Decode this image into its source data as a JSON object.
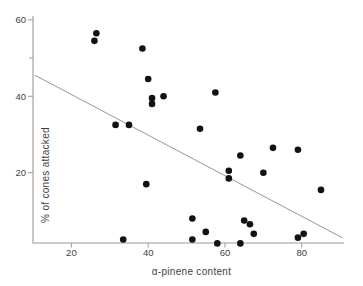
{
  "figure": {
    "background": "#ffffff"
  },
  "chart_data": {
    "type": "scatter",
    "title": "",
    "xlabel": "α-pinene content",
    "ylabel": "% of cones attacked",
    "xlim": [
      10,
      91
    ],
    "ylim": [
      1.6,
      61
    ],
    "x_ticks": [
      20,
      40,
      60,
      80
    ],
    "y_ticks": [
      20,
      40,
      60
    ],
    "y_minor_ticks": [
      50
    ],
    "grid": false,
    "legend": null,
    "points": [
      [
        26.5,
        56.5
      ],
      [
        26,
        54.5
      ],
      [
        38.5,
        52.5
      ],
      [
        40,
        44.5
      ],
      [
        41,
        39.5
      ],
      [
        41,
        38
      ],
      [
        44,
        40
      ],
      [
        31.5,
        32.5
      ],
      [
        35,
        32.5
      ],
      [
        57.5,
        41
      ],
      [
        53.5,
        31.5
      ],
      [
        64,
        24.5
      ],
      [
        72.5,
        26.5
      ],
      [
        79,
        26
      ],
      [
        61,
        20.5
      ],
      [
        61,
        18.5
      ],
      [
        70,
        20
      ],
      [
        85,
        15.5
      ],
      [
        51.5,
        8
      ],
      [
        51.5,
        2.5
      ],
      [
        55,
        4.5
      ],
      [
        58,
        1.5
      ],
      [
        65,
        7.5
      ],
      [
        66.5,
        6.5
      ],
      [
        67.5,
        4
      ],
      [
        64,
        1.5
      ],
      [
        79,
        3
      ],
      [
        80.5,
        4
      ],
      [
        39.5,
        17
      ],
      [
        33.5,
        2.5
      ]
    ],
    "trendline": {
      "x1": 10.5,
      "y1": 45.5,
      "x2": 90.5,
      "y2": 3
    },
    "colors": {
      "dot": "#121212",
      "trend_line": "#8a8a8a",
      "axis": "#9a9a9a",
      "text": "#3f3f3f"
    }
  }
}
